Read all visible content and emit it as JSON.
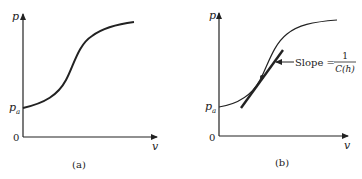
{
  "panels": [
    {
      "id": "a",
      "caption": "(a)",
      "y_axis_label": "p",
      "x_axis_label": "v",
      "origin_label": "0",
      "intercept_label": "p",
      "intercept_subscript": "a"
    },
    {
      "id": "b",
      "caption": "(b)",
      "y_axis_label": "p",
      "x_axis_label": "v",
      "origin_label": "0",
      "intercept_label": "p",
      "intercept_subscript": "a",
      "annotation": {
        "text": "Slope =",
        "numerator": "1",
        "denominator": "C(h)"
      }
    }
  ],
  "colors": {
    "ink": "#222222",
    "background": "#ffffff"
  }
}
